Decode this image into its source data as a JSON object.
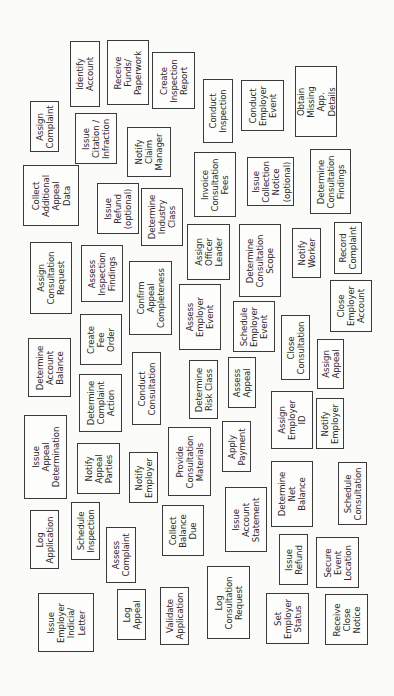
{
  "diagram": {
    "title": "",
    "orientation": "rotated-90-ccw",
    "border_color": "#3a3a3a",
    "text_color": "#2a2a2a",
    "background": "#fbfbfa",
    "cards": [
      {
        "id": "identify-account",
        "label": "Identify\nAccount",
        "x": 70,
        "y": 41,
        "w": 30,
        "h": 66
      },
      {
        "id": "receive-funds-paperwork",
        "label": "Receive\nFunds/\nPaperwork",
        "x": 107,
        "y": 40,
        "w": 42,
        "h": 65
      },
      {
        "id": "create-inspection-report",
        "label": "Create\nInspection\nReport",
        "x": 152,
        "y": 52,
        "w": 43,
        "h": 57
      },
      {
        "id": "conduct-inspection",
        "label": "Conduct\nInspection",
        "x": 203,
        "y": 79,
        "w": 30,
        "h": 64
      },
      {
        "id": "conduct-employer-event",
        "label": "Conduct\nEmployer\nEvent",
        "x": 241,
        "y": 80,
        "w": 43,
        "h": 51
      },
      {
        "id": "obtain-missing-app-details",
        "label": "Obtain\nMissing\nApp. Details",
        "x": 295,
        "y": 66,
        "w": 42,
        "h": 71
      },
      {
        "id": "assign-complaint",
        "label": "Assign\nComplaint",
        "x": 30,
        "y": 101,
        "w": 29,
        "h": 51
      },
      {
        "id": "issue-citation-infraction",
        "label": "Issue\nCitation /\nInfraction",
        "x": 75,
        "y": 113,
        "w": 42,
        "h": 51
      },
      {
        "id": "notify-claim-manager",
        "label": "Notify\nClaim\nManager",
        "x": 127,
        "y": 127,
        "w": 44,
        "h": 50
      },
      {
        "id": "invoice-consultation-fees",
        "label": "Invoice\nConsultation\nFees",
        "x": 194,
        "y": 152,
        "w": 42,
        "h": 65
      },
      {
        "id": "issue-collection-notice-optional",
        "label": "Issue\nCollection\nNotice\n(optional)",
        "x": 247,
        "y": 157,
        "w": 47,
        "h": 49
      },
      {
        "id": "determine-consultation-findings",
        "label": "Determine\nConsultation\nFindings",
        "x": 310,
        "y": 149,
        "w": 41,
        "h": 65
      },
      {
        "id": "collect-additional-appeal-data",
        "label": "Collect\nAdditional\nAppeal\nData",
        "x": 23,
        "y": 165,
        "w": 56,
        "h": 61
      },
      {
        "id": "issue-refund-optional",
        "label": "Issue\nRefund\n(optional)",
        "x": 97,
        "y": 183,
        "w": 42,
        "h": 51
      },
      {
        "id": "determine-industry-class",
        "label": "Determine\nIndustry\nClass",
        "x": 141,
        "y": 188,
        "w": 42,
        "h": 58
      },
      {
        "id": "assign-officer-leader",
        "label": "Assign\nOfficer\nLeader",
        "x": 187,
        "y": 224,
        "w": 43,
        "h": 56
      },
      {
        "id": "determine-consultation-scope",
        "label": "Determine\nConsultation\nScope",
        "x": 239,
        "y": 224,
        "w": 42,
        "h": 73
      },
      {
        "id": "notify-worker",
        "label": "Notify\nWorker",
        "x": 292,
        "y": 228,
        "w": 29,
        "h": 50
      },
      {
        "id": "record-complaint",
        "label": "Record\nComplaint",
        "x": 334,
        "y": 222,
        "w": 28,
        "h": 52
      },
      {
        "id": "assign-consultation-request",
        "label": "Assign\nConsultation\nRequest",
        "x": 30,
        "y": 242,
        "w": 42,
        "h": 72
      },
      {
        "id": "assess-inspection-findings",
        "label": "Assess\nInspection\nFindings",
        "x": 81,
        "y": 245,
        "w": 42,
        "h": 57
      },
      {
        "id": "confirm-appeal-completeness",
        "label": "Confirm\nAppeal\nCompleteness",
        "x": 129,
        "y": 261,
        "w": 43,
        "h": 74
      },
      {
        "id": "close-employer-account",
        "label": "Close\nEmployer\nAccount",
        "x": 330,
        "y": 280,
        "w": 42,
        "h": 52
      },
      {
        "id": "assess-employer-event",
        "label": "Assess\nEmployer\nEvent",
        "x": 179,
        "y": 284,
        "w": 42,
        "h": 66
      },
      {
        "id": "schedule-employer-event",
        "label": "Schedule\nEmployer\nEvent",
        "x": 233,
        "y": 301,
        "w": 42,
        "h": 51
      },
      {
        "id": "create-fee-order",
        "label": "Create\nFee\nOrder",
        "x": 80,
        "y": 314,
        "w": 42,
        "h": 51
      },
      {
        "id": "close-consultation",
        "label": "Close\nConsultation",
        "x": 281,
        "y": 315,
        "w": 29,
        "h": 65
      },
      {
        "id": "determine-account-balance",
        "label": "Determine\nAccount\nBalance",
        "x": 28,
        "y": 338,
        "w": 43,
        "h": 59
      },
      {
        "id": "assign-appeal",
        "label": "Assign\nAppeal",
        "x": 317,
        "y": 339,
        "w": 27,
        "h": 50
      },
      {
        "id": "conduct-consultation",
        "label": "Conduct\nConsultation",
        "x": 132,
        "y": 352,
        "w": 29,
        "h": 73
      },
      {
        "id": "assess-appeal",
        "label": "Assess\nAppeal",
        "x": 228,
        "y": 357,
        "w": 28,
        "h": 51
      },
      {
        "id": "determine-risk-class",
        "label": "Determine\nRisk Class",
        "x": 189,
        "y": 360,
        "w": 29,
        "h": 59
      },
      {
        "id": "determine-complaint-action",
        "label": "Determine\nComplaint\nAction",
        "x": 79,
        "y": 374,
        "w": 43,
        "h": 58
      },
      {
        "id": "assign-employer-id",
        "label": "Assign\nEmployer\nID",
        "x": 271,
        "y": 391,
        "w": 42,
        "h": 58
      },
      {
        "id": "notify-employer-right",
        "label": "Notify\nEmployer",
        "x": 316,
        "y": 398,
        "w": 28,
        "h": 51
      },
      {
        "id": "issue-appeal-determination",
        "label": "Issue\nAppeal\nDetermination",
        "x": 24,
        "y": 415,
        "w": 43,
        "h": 84
      },
      {
        "id": "apply-payment",
        "label": "Apply\nPayment",
        "x": 222,
        "y": 421,
        "w": 29,
        "h": 51
      },
      {
        "id": "provide-consultation-materials",
        "label": "Provide\nConsultation\nMaterials",
        "x": 168,
        "y": 427,
        "w": 43,
        "h": 69
      },
      {
        "id": "notify-appeal-parties",
        "label": "Notify\nAppeal\nParties",
        "x": 77,
        "y": 443,
        "w": 43,
        "h": 51
      },
      {
        "id": "notify-employer-mid",
        "label": "Notify\nEmployer",
        "x": 129,
        "y": 452,
        "w": 29,
        "h": 51
      },
      {
        "id": "determine-net-balance",
        "label": "Determine\nNet\nBalance",
        "x": 271,
        "y": 461,
        "w": 42,
        "h": 66
      },
      {
        "id": "schedule-consultation",
        "label": "Schedule\nConsultation",
        "x": 338,
        "y": 462,
        "w": 29,
        "h": 63
      },
      {
        "id": "issue-account-statement",
        "label": "Issue\nAccount\nStatement",
        "x": 225,
        "y": 487,
        "w": 42,
        "h": 65
      },
      {
        "id": "schedule-inspection",
        "label": "Schedule\nInspection",
        "x": 71,
        "y": 502,
        "w": 29,
        "h": 58
      },
      {
        "id": "collect-balance-due",
        "label": "Collect\nBalance\nDue",
        "x": 162,
        "y": 505,
        "w": 42,
        "h": 51
      },
      {
        "id": "log-application",
        "label": "Log\nApplication",
        "x": 30,
        "y": 510,
        "w": 29,
        "h": 59
      },
      {
        "id": "assess-complaint",
        "label": "Assess\nComplaint",
        "x": 106,
        "y": 527,
        "w": 30,
        "h": 56
      },
      {
        "id": "issue-refund",
        "label": "Issue\nRefund",
        "x": 279,
        "y": 534,
        "w": 29,
        "h": 51
      },
      {
        "id": "secure-event-location",
        "label": "Secure\nEvent\nLocation",
        "x": 316,
        "y": 537,
        "w": 43,
        "h": 51
      },
      {
        "id": "log-consultation-request",
        "label": "Log\nConsultation\nRequest",
        "x": 207,
        "y": 566,
        "w": 43,
        "h": 73
      },
      {
        "id": "validate-application",
        "label": "Validate\nApplication",
        "x": 160,
        "y": 587,
        "w": 29,
        "h": 58
      },
      {
        "id": "log-appeal",
        "label": "Log\nAppeal",
        "x": 117,
        "y": 589,
        "w": 29,
        "h": 51
      },
      {
        "id": "issue-employer-indicia-letter",
        "label": "Issue\nEmployer\nIndicia/\nLetter",
        "x": 38,
        "y": 593,
        "w": 56,
        "h": 59
      },
      {
        "id": "set-employer-status",
        "label": "Set\nEmployer\nStatus",
        "x": 266,
        "y": 593,
        "w": 43,
        "h": 51
      },
      {
        "id": "receive-close-notice",
        "label": "Receive\nClose\nNotice",
        "x": 325,
        "y": 594,
        "w": 43,
        "h": 51
      }
    ]
  }
}
